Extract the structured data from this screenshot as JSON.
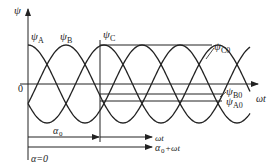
{
  "diagram": {
    "axes": {
      "y_label": "ψ",
      "x_label": "ωt",
      "origin_label": "0"
    },
    "curves": [
      {
        "name": "ψ",
        "sub": "A",
        "phase_deg": 0
      },
      {
        "name": "ψ",
        "sub": "B",
        "phase_deg": -120
      },
      {
        "name": "ψ",
        "sub": "C",
        "phase_deg": 120
      }
    ],
    "level_labels": [
      {
        "name": "ψ",
        "sub": "C0"
      },
      {
        "name": "ψ",
        "sub": "B0"
      },
      {
        "name": "ψ",
        "sub": "A0"
      }
    ],
    "arrows": {
      "alpha0_label": "α",
      "alpha0_sub": "0",
      "omega_t_label": "ωt",
      "sum_label_a": "α",
      "sum_label_sub": "0",
      "sum_label_b": "+ωt",
      "alpha_zero_label": "α=0"
    },
    "colors": {
      "stroke": "#222222",
      "background": "#ffffff"
    }
  }
}
